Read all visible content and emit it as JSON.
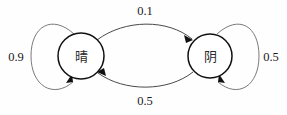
{
  "diagram": {
    "type": "state-transition-diagram",
    "nodes": [
      {
        "id": "sunny",
        "label": "晴",
        "cx": 81,
        "cy": 56,
        "r": 23
      },
      {
        "id": "cloudy",
        "label": "阴",
        "cx": 210,
        "cy": 56,
        "r": 22
      }
    ],
    "edges": [
      {
        "id": "sunny-to-sunny",
        "from": "sunny",
        "to": "sunny",
        "weight": "0.9",
        "label_x": 16,
        "label_y": 57,
        "kind": "self-loop"
      },
      {
        "id": "sunny-to-cloudy",
        "from": "sunny",
        "to": "cloudy",
        "weight": "0.1",
        "label_x": 145,
        "label_y": 11,
        "kind": "arc-top"
      },
      {
        "id": "cloudy-to-sunny",
        "from": "cloudy",
        "to": "sunny",
        "weight": "0.5",
        "label_x": 145,
        "label_y": 101,
        "kind": "arc-bottom"
      },
      {
        "id": "cloudy-to-cloudy",
        "from": "cloudy",
        "to": "cloudy",
        "weight": "0.5",
        "label_x": 271,
        "label_y": 57,
        "kind": "self-loop"
      }
    ],
    "colors": {
      "background": "#fefefe",
      "node_stroke": "#111111",
      "node_fill": "#ffffff",
      "edge_stroke": "#4a4a4a",
      "loop_stroke": "#6b6b6b",
      "text": "#1a1a1a"
    }
  }
}
